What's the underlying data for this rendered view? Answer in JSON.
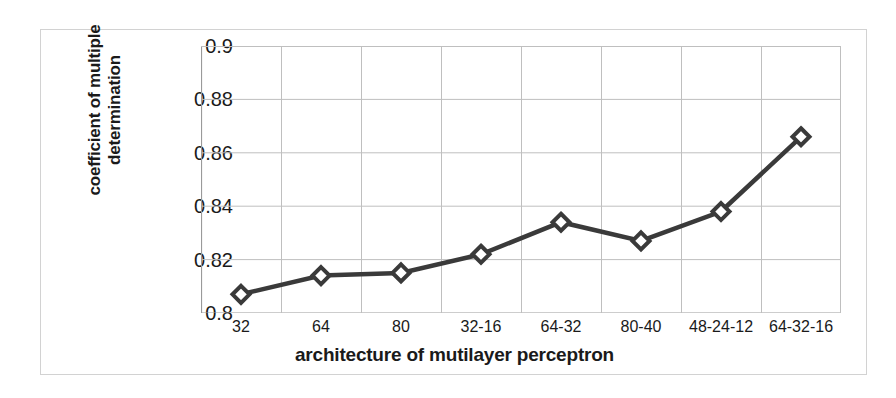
{
  "chart_data": {
    "type": "line",
    "title": "",
    "xlabel": "architecture of mutilayer perceptron",
    "ylabel": "coefficient of multiple determination",
    "ylabel_line1": "coefficient of multiple",
    "ylabel_line2": "determination",
    "categories": [
      "32",
      "64",
      "80",
      "32-16",
      "64-32",
      "80-40",
      "48-24-12",
      "64-32-16"
    ],
    "values": [
      0.807,
      0.814,
      0.815,
      0.822,
      0.834,
      0.827,
      0.838,
      0.866
    ],
    "series": [
      {
        "name": "coefficient of multiple determination",
        "values": [
          0.807,
          0.814,
          0.815,
          0.822,
          0.834,
          0.827,
          0.838,
          0.866
        ]
      }
    ],
    "ylim": [
      0.8,
      0.9
    ],
    "yticks": [
      "0.8",
      "0.82",
      "0.84",
      "0.86",
      "0.88",
      "0.9"
    ],
    "ytick_values": [
      0.8,
      0.82,
      0.84,
      0.86,
      0.88,
      0.9
    ],
    "grid": true,
    "grid_axes": "both",
    "legend": "none",
    "marker": "diamond",
    "line_color": "#3a3a3a",
    "marker_fill": "#ffffff",
    "marker_edge_color": "#3a3a3a",
    "grid_color": "#bfbfbf",
    "axis_color": "#9a9a9a",
    "background_color": "#ffffff",
    "frame_color": "#d2d2d2"
  }
}
